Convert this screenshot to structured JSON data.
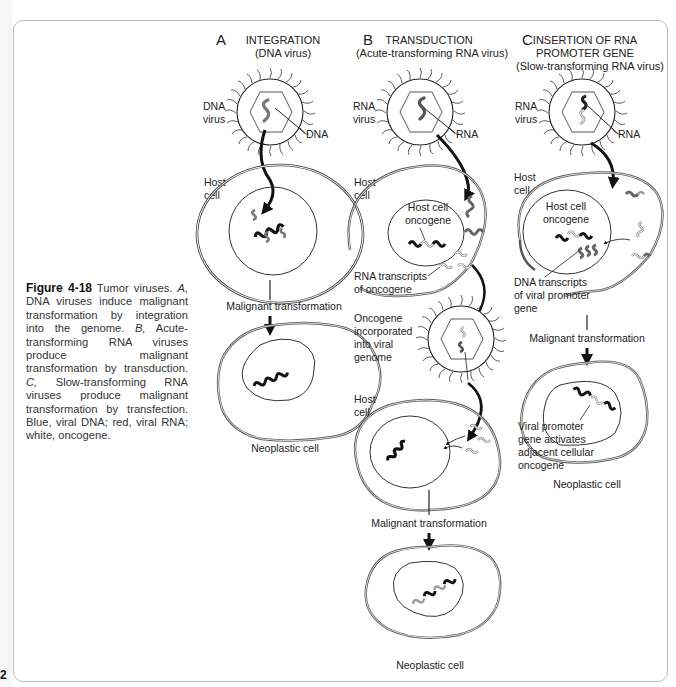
{
  "page": {
    "number": "2"
  },
  "caption": {
    "figure_label": "Figure 4-18",
    "text_parts": [
      " Tumor viruses. ",
      "A,",
      " DNA viruses induce malignant transformation by integration into the genome. ",
      "B,",
      " Acute-transforming RNA viruses produce malignant transformation by transduction. ",
      "C,",
      " Slow-transforming RNA viruses produce malignant transformation by transfection. Blue, viral DNA; red, viral RNA; white, oncogene."
    ]
  },
  "panels": {
    "a": {
      "letter": "A",
      "title": "INTEGRATION",
      "subtitle": "(DNA virus)",
      "virus_label_1": "DNA",
      "virus_label_2": "virus",
      "genome_label": "DNA",
      "host_label_1": "Host",
      "host_label_2": "cell",
      "step": "Malignant transformation",
      "result": "Neoplastic cell"
    },
    "b": {
      "letter": "B",
      "title": "TRANSDUCTION",
      "subtitle": "(Acute-transforming RNA virus)",
      "virus_label_1": "RNA",
      "virus_label_2": "virus",
      "genome_label": "RNA",
      "host_label_1": "Host",
      "host_label_2": "cell",
      "oncogene_label_1": "Host cell",
      "oncogene_label_2": "oncogene",
      "transcripts_label_1": "RNA transcripts",
      "transcripts_label_2": "of oncogene",
      "incorporated_1": "Oncogene",
      "incorporated_2": "incorporated",
      "incorporated_3": "into viral",
      "incorporated_4": "genome",
      "host2_label_1": "Host",
      "host2_label_2": "cell",
      "step": "Malignant transformation",
      "result": "Neoplastic cell"
    },
    "c": {
      "letter": "C",
      "title_1": "INSERTION OF RNA",
      "title_2": "PROMOTER GENE",
      "subtitle": "(Slow-transforming RNA virus)",
      "virus_label_1": "RNA",
      "virus_label_2": "virus",
      "genome_label": "RNA",
      "host_label_1": "Host",
      "host_label_2": "cell",
      "oncogene_label_1": "Host cell",
      "oncogene_label_2": "oncogene",
      "transcripts_label_1": "DNA transcripts",
      "transcripts_label_2": "of viral promoter",
      "transcripts_label_3": "gene",
      "step": "Malignant transformation",
      "activates_1": "Viral promoter",
      "activates_2": "gene activates",
      "activates_3": "adjacent cellular",
      "activates_4": "oncogene",
      "result": "Neoplastic cell"
    }
  },
  "colors": {
    "frame": "#bdbdbd",
    "dark_gene": "#111111",
    "viral_gene": "#777777",
    "oncogene_outline": "#999999"
  }
}
